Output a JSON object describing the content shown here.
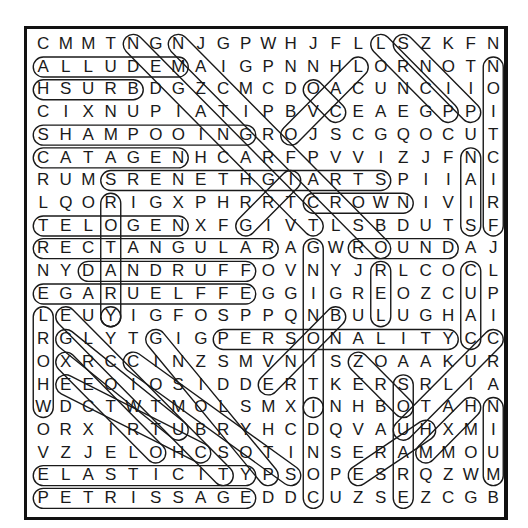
{
  "puzzle": {
    "title": "Word Search",
    "rows": [
      "CMMTNGNJGPWHJFLLSZKFN",
      "ALLUDEMAIGPNNHLORNOTN",
      "HSURBDGZCMCDOACUNCIIO",
      "CIXNUPIATIPBVCEAEGPPI",
      "SHAMPOOINGROJSCGQOCUT",
      "CATAGENHCARFPVVIZJFNC",
      "RUMSRENETHGIARTSPIIAI",
      "LQORIGXPHRRTCROWNIVIR",
      "TELOGENXFGIVTLSBDUTSF",
      "RECTANGULARAGWROUNDAJ",
      "NYDANDRUFFOVNYJRLCOCL",
      "EGARUELFFEGGIGREOZCUP",
      "LEUYIGFOSPPQNBULUGHAI",
      "RGLYTGIGPERSONALITYCC",
      "OXRCCINZSMVNISZOAAKUR",
      "HEEOIOSIDDERTKERSRLIA",
      "WDCTWTMOLSMXINHBOTAHN",
      "ORXIRTUBRYHCDQVAUHXMI",
      "VZJELOHCSOTINSERAMMOU",
      "ELASTICITYPSOPESRQZWM",
      "PETRISSAGEDDCUZSEZCGB"
    ],
    "found_words": [
      {
        "word": "ALLUDEM",
        "start": [
          1,
          0
        ],
        "end": [
          1,
          6
        ]
      },
      {
        "word": "HSURB",
        "start": [
          2,
          0
        ],
        "end": [
          2,
          4
        ]
      },
      {
        "word": "SHAMPOOING",
        "start": [
          4,
          0
        ],
        "end": [
          4,
          9
        ]
      },
      {
        "word": "CATAGEN",
        "start": [
          5,
          0
        ],
        "end": [
          5,
          6
        ]
      },
      {
        "word": "SRENETHGIARTS",
        "start": [
          6,
          3
        ],
        "end": [
          6,
          15
        ]
      },
      {
        "word": "TELOGEN",
        "start": [
          8,
          0
        ],
        "end": [
          8,
          6
        ]
      },
      {
        "word": "RECTANGULAR",
        "start": [
          9,
          0
        ],
        "end": [
          9,
          10
        ]
      },
      {
        "word": "CROWN",
        "start": [
          7,
          12
        ],
        "end": [
          7,
          16
        ]
      },
      {
        "word": "ROUND",
        "start": [
          9,
          14
        ],
        "end": [
          9,
          18
        ]
      },
      {
        "word": "DANDRUFF",
        "start": [
          10,
          2
        ],
        "end": [
          10,
          9
        ]
      },
      {
        "word": "EGARUELFFE",
        "start": [
          11,
          0
        ],
        "end": [
          11,
          9
        ]
      },
      {
        "word": "PERSONALITY",
        "start": [
          13,
          8
        ],
        "end": [
          13,
          18
        ]
      },
      {
        "word": "ELASTICITY",
        "start": [
          19,
          0
        ],
        "end": [
          19,
          9
        ]
      },
      {
        "word": "PETRISSAGE",
        "start": [
          20,
          0
        ],
        "end": [
          20,
          9
        ]
      },
      {
        "word": "NOITCIRF",
        "start": [
          1,
          20
        ],
        "end": [
          8,
          20
        ]
      },
      {
        "word": "NAIS",
        "start": [
          5,
          19
        ],
        "end": [
          8,
          19
        ]
      },
      {
        "word": "ROTARY",
        "start": [
          7,
          3
        ],
        "end": [
          12,
          3
        ]
      },
      {
        "word": "LOREHW",
        "start": [
          12,
          0
        ],
        "end": [
          16,
          0
        ]
      },
      {
        "word": "REL",
        "start": [
          10,
          15
        ],
        "end": [
          12,
          15
        ]
      },
      {
        "word": "CUAC",
        "start": [
          10,
          19
        ],
        "end": [
          13,
          19
        ]
      },
      {
        "word": "GNIT",
        "start": [
          9,
          12
        ],
        "end": [
          16,
          12
        ]
      },
      {
        "word": "INDOC",
        "start": [
          16,
          12
        ],
        "end": [
          20,
          12
        ]
      },
      {
        "word": "SQUARE",
        "start": [
          15,
          16
        ],
        "end": [
          20,
          16
        ]
      },
      {
        "word": "NIUM",
        "start": [
          16,
          20
        ],
        "end": [
          19,
          20
        ]
      },
      {
        "word": "NGN diagonal",
        "start": [
          0,
          4
        ],
        "end": [
          8,
          12
        ]
      },
      {
        "word": "NJ diagonal",
        "start": [
          0,
          6
        ],
        "end": [
          9,
          15
        ]
      },
      {
        "word": "LLORNOCICP",
        "start": [
          0,
          15
        ],
        "end": [
          3,
          18
        ]
      },
      {
        "word": "SZKF",
        "start": [
          0,
          16
        ],
        "end": [
          3,
          19
        ]
      },
      {
        "word": "LOVCS",
        "start": [
          1,
          14
        ],
        "end": [
          4,
          11
        ]
      },
      {
        "word": "OACUN",
        "start": [
          2,
          12
        ],
        "end": [
          3,
          13
        ]
      },
      {
        "word": "GIART",
        "start": [
          8,
          9
        ],
        "end": [
          6,
          11
        ]
      },
      {
        "word": "BNIV",
        "start": [
          12,
          13
        ],
        "end": [
          15,
          10
        ]
      },
      {
        "word": "CLURA",
        "start": [
          13,
          20
        ],
        "end": [
          17,
          16
        ]
      },
      {
        "word": "MAH",
        "start": [
          18,
          17
        ],
        "end": [
          16,
          19
        ]
      },
      {
        "word": "ESAUH",
        "start": [
          19,
          14
        ],
        "end": [
          17,
          17
        ]
      },
      {
        "word": "SZOAKR",
        "start": [
          14,
          14
        ],
        "end": [
          16,
          16
        ]
      },
      {
        "word": "E diag",
        "start": [
          12,
          1
        ],
        "end": [
          19,
          8
        ]
      },
      {
        "word": "G diag",
        "start": [
          13,
          1
        ],
        "end": [
          17,
          6
        ]
      },
      {
        "word": "X diag",
        "start": [
          14,
          1
        ],
        "end": [
          18,
          5
        ]
      },
      {
        "word": "E2 diag",
        "start": [
          15,
          1
        ],
        "end": [
          18,
          7
        ]
      },
      {
        "word": "C diag",
        "start": [
          14,
          4
        ],
        "end": [
          19,
          11
        ]
      },
      {
        "word": "G2 diag",
        "start": [
          13,
          5
        ],
        "end": [
          19,
          10
        ]
      },
      {
        "word": "Y",
        "start": [
          12,
          3
        ],
        "end": [
          12,
          3
        ]
      }
    ]
  }
}
